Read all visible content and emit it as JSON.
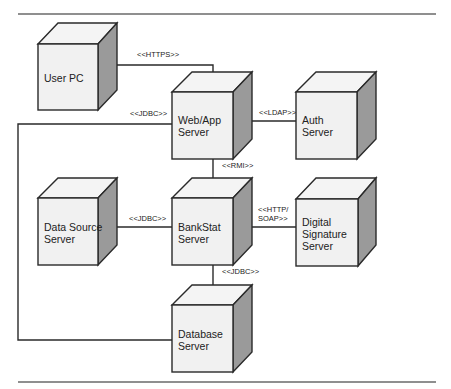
{
  "diagram": {
    "type": "uml-deployment-diagram",
    "nodes": [
      {
        "id": "user-pc",
        "label_lines": [
          "User PC"
        ]
      },
      {
        "id": "web-app-server",
        "label_lines": [
          "Web/App",
          "Server"
        ]
      },
      {
        "id": "auth-server",
        "label_lines": [
          "Auth",
          "Server"
        ]
      },
      {
        "id": "data-source-server",
        "label_lines": [
          "Data Source",
          "Server"
        ]
      },
      {
        "id": "bankstat-server",
        "label_lines": [
          "BankStat",
          "Server"
        ]
      },
      {
        "id": "digital-signature-server",
        "label_lines": [
          "Digital",
          "Signature",
          "Server"
        ]
      },
      {
        "id": "database-server",
        "label_lines": [
          "Database",
          "Server"
        ]
      }
    ],
    "connections": [
      {
        "from": "user-pc",
        "to": "web-app-server",
        "label_lines": [
          "<<HTTPS>>"
        ]
      },
      {
        "from": "web-app-server",
        "to": "auth-server",
        "label_lines": [
          "<<LDAP>>"
        ]
      },
      {
        "from": "web-app-server",
        "to": "database-server",
        "label_lines": [
          "<<JDBC>>"
        ]
      },
      {
        "from": "web-app-server",
        "to": "bankstat-server",
        "label_lines": [
          "<<RMI>>"
        ]
      },
      {
        "from": "data-source-server",
        "to": "bankstat-server",
        "label_lines": [
          "<<JDBC>>"
        ]
      },
      {
        "from": "bankstat-server",
        "to": "digital-signature-server",
        "label_lines": [
          "<<HTTP/",
          "SOAP>>"
        ]
      },
      {
        "from": "bankstat-server",
        "to": "database-server",
        "label_lines": [
          "<<JDBC>>"
        ]
      }
    ],
    "colors": {
      "front_face": "#f1f1f1",
      "top_face": "#f4f4f4",
      "side_face": "#9a9a9a",
      "stroke": "#2a2a2a"
    }
  }
}
